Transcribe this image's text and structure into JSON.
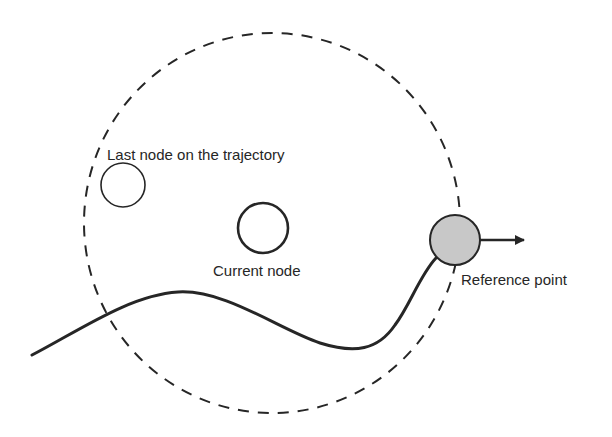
{
  "diagram": {
    "labels": {
      "last_node": "Last node on the trajectory",
      "current_node": "Current node",
      "reference_point": "Reference point"
    },
    "colors": {
      "stroke": "#262626",
      "reference_fill": "#c8c8c8",
      "background": "#ffffff"
    },
    "elements": [
      {
        "name": "search-boundary",
        "kind": "dashed circle"
      },
      {
        "name": "last-node",
        "kind": "hollow circle"
      },
      {
        "name": "current-node",
        "kind": "hollow circle (bold)"
      },
      {
        "name": "reference-point",
        "kind": "filled gray circle"
      },
      {
        "name": "direction-arrow",
        "kind": "arrow pointing right"
      },
      {
        "name": "trajectory",
        "kind": "curved line"
      }
    ]
  }
}
